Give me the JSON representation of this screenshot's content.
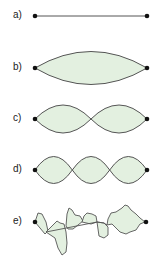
{
  "figure": {
    "fill_color": "#e3f0e0",
    "stroke_color": "#555555",
    "node_color": "#111111",
    "panels": [
      {
        "label": "a)",
        "description": "string at rest (straight line)"
      },
      {
        "label": "b)",
        "description": "fundamental mode, one loop"
      },
      {
        "label": "c)",
        "description": "second harmonic, two loops"
      },
      {
        "label": "d)",
        "description": "third harmonic, three loops"
      },
      {
        "label": "e)",
        "description": "irregular superposition of modes"
      }
    ]
  }
}
